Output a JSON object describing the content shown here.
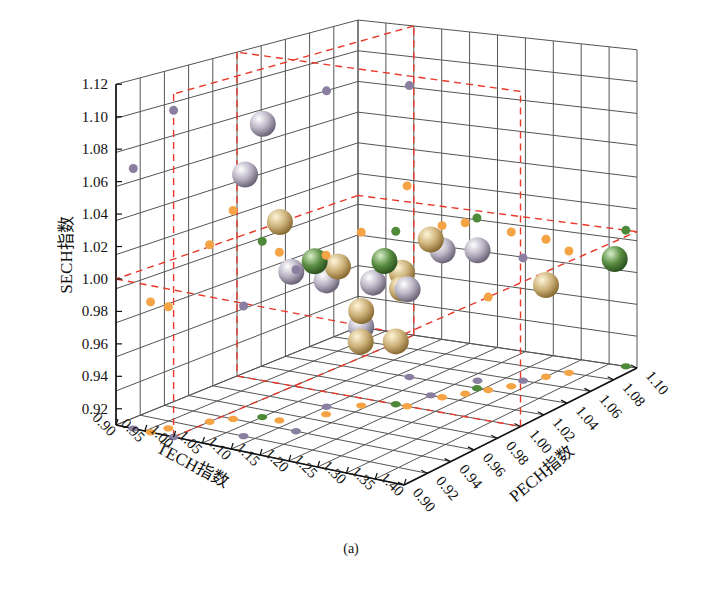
{
  "chart_data": {
    "type": "scatter3d",
    "caption": "(a)",
    "axes": {
      "x": {
        "label": "TECH指数",
        "range": [
          0.9,
          1.4
        ],
        "ticks": [
          "0.90",
          "0.95",
          "1.00",
          "1.05",
          "1.10",
          "1.15",
          "1.20",
          "1.25",
          "1.30",
          "1.35",
          "1.40"
        ]
      },
      "y": {
        "label": "PECH指数",
        "range": [
          0.9,
          1.1
        ],
        "ticks": [
          "0.90",
          "0.92",
          "0.94",
          "0.96",
          "0.98",
          "1.00",
          "1.02",
          "1.04",
          "1.06",
          "1.08",
          "1.10"
        ]
      },
      "z": {
        "label": "SECH指数",
        "range": [
          0.91,
          1.12
        ],
        "ticks": [
          "0.92",
          "0.94",
          "0.96",
          "0.98",
          "1.00",
          "1.02",
          "1.04",
          "1.06",
          "1.08",
          "1.10",
          "1.12"
        ]
      }
    },
    "grid": true,
    "reference_planes": {
      "x": 1.0,
      "y": 1.0,
      "z": 1.0,
      "color": "#e8392a",
      "style": "dashed"
    },
    "series": [
      {
        "name": "purple",
        "color": "#8a7fa0",
        "points": [
          {
            "x": 0.93,
            "y": 0.9,
            "z": 1.07
          },
          {
            "x": 1.0,
            "y": 0.9,
            "z": 1.11
          },
          {
            "x": 1.1,
            "y": 0.98,
            "z": 1.11
          },
          {
            "x": 1.12,
            "y": 1.04,
            "z": 1.1
          },
          {
            "x": 1.08,
            "y": 0.92,
            "z": 0.99
          },
          {
            "x": 1.13,
            "y": 0.94,
            "z": 1.01
          },
          {
            "x": 1.2,
            "y": 1.02,
            "z": 1.01
          },
          {
            "x": 1.22,
            "y": 1.05,
            "z": 1.0
          },
          {
            "x": 1.28,
            "y": 1.06,
            "z": 0.99
          }
        ]
      },
      {
        "name": "orange",
        "color": "#f5a445",
        "points": [
          {
            "x": 0.96,
            "y": 0.9,
            "z": 0.99
          },
          {
            "x": 0.97,
            "y": 0.91,
            "z": 0.985
          },
          {
            "x": 1.0,
            "y": 0.93,
            "z": 1.02
          },
          {
            "x": 1.02,
            "y": 0.94,
            "z": 1.04
          },
          {
            "x": 1.08,
            "y": 0.95,
            "z": 1.015
          },
          {
            "x": 1.12,
            "y": 0.97,
            "z": 1.01
          },
          {
            "x": 1.14,
            "y": 0.99,
            "z": 1.02
          },
          {
            "x": 1.2,
            "y": 1.0,
            "z": 1.05
          },
          {
            "x": 1.22,
            "y": 1.02,
            "z": 1.02
          },
          {
            "x": 1.24,
            "y": 1.03,
            "z": 1.02
          },
          {
            "x": 1.28,
            "y": 1.05,
            "z": 1.01
          },
          {
            "x": 1.3,
            "y": 1.07,
            "z": 1.0
          },
          {
            "x": 1.32,
            "y": 1.08,
            "z": 0.99
          },
          {
            "x": 1.26,
            "y": 1.04,
            "z": 0.97
          }
        ]
      },
      {
        "name": "green",
        "color": "#4f8a3a",
        "points": [
          {
            "x": 1.05,
            "y": 0.95,
            "z": 1.02
          },
          {
            "x": 1.18,
            "y": 1.0,
            "z": 1.02
          },
          {
            "x": 1.24,
            "y": 1.04,
            "z": 1.02
          },
          {
            "x": 1.38,
            "y": 1.1,
            "z": 1.0
          }
        ]
      },
      {
        "name": "large-silver",
        "color": "#b9b3c4",
        "size": "large",
        "points": [
          {
            "x": 1.03,
            "y": 0.96,
            "z": 1.09
          },
          {
            "x": 1.02,
            "y": 0.95,
            "z": 1.06
          },
          {
            "x": 1.1,
            "y": 0.98,
            "z": 0.99
          },
          {
            "x": 1.08,
            "y": 0.96,
            "z": 1.0
          },
          {
            "x": 1.14,
            "y": 1.0,
            "z": 0.985
          },
          {
            "x": 1.14,
            "y": 0.99,
            "z": 0.96
          },
          {
            "x": 1.2,
            "y": 1.03,
            "z": 1.0
          },
          {
            "x": 1.22,
            "y": 1.05,
            "z": 0.995
          },
          {
            "x": 1.18,
            "y": 1.01,
            "z": 0.98
          }
        ]
      },
      {
        "name": "large-gold",
        "color": "#cdb27a",
        "size": "large",
        "points": [
          {
            "x": 1.06,
            "y": 0.96,
            "z": 1.03
          },
          {
            "x": 1.12,
            "y": 0.98,
            "z": 1.0
          },
          {
            "x": 1.14,
            "y": 0.99,
            "z": 0.97
          },
          {
            "x": 1.17,
            "y": 1.01,
            "z": 0.99
          },
          {
            "x": 1.17,
            "y": 1.01,
            "z": 0.98
          },
          {
            "x": 1.16,
            "y": 0.98,
            "z": 0.955
          },
          {
            "x": 1.2,
            "y": 1.02,
            "z": 1.01
          },
          {
            "x": 1.3,
            "y": 1.07,
            "z": 0.97
          },
          {
            "x": 1.18,
            "y": 1.0,
            "z": 0.95
          }
        ]
      },
      {
        "name": "large-green",
        "color": "#5c8f44",
        "size": "large",
        "points": [
          {
            "x": 1.1,
            "y": 0.97,
            "z": 1.005
          },
          {
            "x": 1.16,
            "y": 1.0,
            "z": 1.0
          },
          {
            "x": 1.36,
            "y": 1.1,
            "z": 0.98
          }
        ]
      }
    ]
  }
}
